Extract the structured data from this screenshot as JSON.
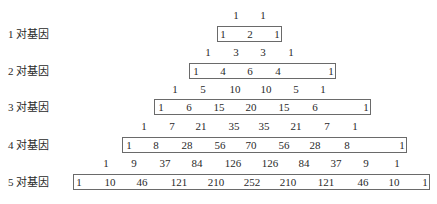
{
  "labels": [
    "1 对基因",
    "2 对基因",
    "3 对基因",
    "4 对基因",
    "5 对基因"
  ],
  "intermediate_rows": [
    [
      1,
      1
    ],
    [
      1,
      3,
      3,
      1
    ],
    [
      1,
      5,
      10,
      10,
      5,
      1
    ],
    [
      1,
      7,
      21,
      35,
      35,
      21,
      7,
      1
    ],
    [
      1,
      9,
      37,
      84,
      126,
      126,
      84,
      37,
      9,
      1
    ]
  ],
  "boxed_rows": [
    [
      1,
      2,
      1
    ],
    [
      1,
      4,
      6,
      4,
      1
    ],
    [
      1,
      6,
      15,
      20,
      15,
      6,
      1
    ],
    [
      1,
      8,
      28,
      56,
      70,
      56,
      28,
      8,
      1
    ],
    [
      1,
      10,
      46,
      121,
      210,
      252,
      210,
      121,
      46,
      10,
      1
    ]
  ]
}
